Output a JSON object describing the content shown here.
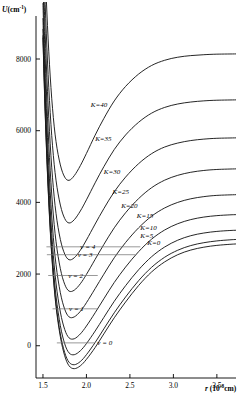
{
  "figure": {
    "y_axis": {
      "label_main": "U",
      "label_units": "(cm",
      "label_exp": "-1",
      "label_close": ")"
    },
    "x_axis": {
      "label_main": "r",
      "label_units": "(10",
      "label_exp": "-8",
      "label_close": "cm)"
    }
  },
  "chart_data": {
    "type": "line",
    "title": "",
    "xlabel": "r (10^-8 cm)",
    "ylabel": "U (cm^-1)",
    "xlim": [
      1.42,
      3.72
    ],
    "ylim": [
      -900,
      9200
    ],
    "xticks": [
      1.5,
      2.0,
      2.5,
      3.0,
      3.5
    ],
    "xticklabels": [
      "1.5",
      "2.0",
      "2.5",
      "3.0",
      "3.5"
    ],
    "yticks": [
      0,
      2000,
      4000,
      6000,
      8000
    ],
    "yticklabels": [
      "0",
      "2000",
      "4000",
      "6000",
      "8000"
    ],
    "grid": false,
    "legend": "inline-annotations",
    "series": [
      {
        "name": "K=0",
        "K": 0,
        "label": "K=0",
        "label_x": 2.7,
        "label_y": 2760,
        "values": [
          [
            1.5,
            8600
          ],
          [
            1.52,
            6900
          ],
          [
            1.545,
            5200
          ],
          [
            1.575,
            3600
          ],
          [
            1.61,
            2200
          ],
          [
            1.65,
            1100
          ],
          [
            1.7,
            250
          ],
          [
            1.75,
            -280
          ],
          [
            1.8,
            -560
          ],
          [
            1.86,
            -640
          ],
          [
            1.93,
            -560
          ],
          [
            2.0,
            -380
          ],
          [
            2.1,
            -50
          ],
          [
            2.2,
            330
          ],
          [
            2.32,
            780
          ],
          [
            2.45,
            1220
          ],
          [
            2.6,
            1680
          ],
          [
            2.75,
            2060
          ],
          [
            2.9,
            2340
          ],
          [
            3.05,
            2540
          ],
          [
            3.2,
            2670
          ],
          [
            3.35,
            2750
          ],
          [
            3.5,
            2800
          ],
          [
            3.65,
            2830
          ],
          [
            3.72,
            2840
          ]
        ]
      },
      {
        "name": "K=5",
        "K": 5,
        "label": "K=5",
        "label_x": 2.62,
        "label_y": 2960,
        "values": [
          [
            1.5,
            8660
          ],
          [
            1.52,
            6960
          ],
          [
            1.545,
            5260
          ],
          [
            1.575,
            3665
          ],
          [
            1.61,
            2270
          ],
          [
            1.65,
            1175
          ],
          [
            1.7,
            330
          ],
          [
            1.75,
            -190
          ],
          [
            1.8,
            -460
          ],
          [
            1.86,
            -530
          ],
          [
            1.93,
            -440
          ],
          [
            2.0,
            -250
          ],
          [
            2.1,
            90
          ],
          [
            2.2,
            470
          ],
          [
            2.32,
            920
          ],
          [
            2.45,
            1360
          ],
          [
            2.6,
            1815
          ],
          [
            2.75,
            2190
          ],
          [
            2.9,
            2470
          ],
          [
            3.05,
            2665
          ],
          [
            3.2,
            2795
          ],
          [
            3.35,
            2875
          ],
          [
            3.5,
            2925
          ],
          [
            3.65,
            2955
          ],
          [
            3.72,
            2965
          ]
        ]
      },
      {
        "name": "K=10",
        "K": 10,
        "label": "K=10",
        "label_x": 2.62,
        "label_y": 3180,
        "values": [
          [
            1.5,
            8840
          ],
          [
            1.52,
            7140
          ],
          [
            1.545,
            5450
          ],
          [
            1.575,
            3860
          ],
          [
            1.61,
            2475
          ],
          [
            1.65,
            1390
          ],
          [
            1.7,
            560
          ],
          [
            1.75,
            55
          ],
          [
            1.8,
            -200
          ],
          [
            1.86,
            -250
          ],
          [
            1.93,
            -140
          ],
          [
            2.0,
            60
          ],
          [
            2.1,
            410
          ],
          [
            2.2,
            790
          ],
          [
            2.32,
            1240
          ],
          [
            2.45,
            1675
          ],
          [
            2.6,
            2120
          ],
          [
            2.75,
            2485
          ],
          [
            2.9,
            2755
          ],
          [
            3.05,
            2945
          ],
          [
            3.2,
            3070
          ],
          [
            3.35,
            3145
          ],
          [
            3.5,
            3190
          ],
          [
            3.65,
            3215
          ],
          [
            3.72,
            3222
          ]
        ]
      },
      {
        "name": "K=15",
        "K": 15,
        "label": "K=15",
        "label_x": 2.58,
        "label_y": 3520,
        "values": [
          [
            1.5,
            9140
          ],
          [
            1.52,
            7445
          ],
          [
            1.545,
            5765
          ],
          [
            1.575,
            4190
          ],
          [
            1.61,
            2820
          ],
          [
            1.65,
            1750
          ],
          [
            1.7,
            940
          ],
          [
            1.75,
            455
          ],
          [
            1.8,
            220
          ],
          [
            1.86,
            195
          ],
          [
            1.93,
            330
          ],
          [
            2.0,
            550
          ],
          [
            2.1,
            920
          ],
          [
            2.2,
            1310
          ],
          [
            2.32,
            1765
          ],
          [
            2.45,
            2195
          ],
          [
            2.6,
            2625
          ],
          [
            2.75,
            2975
          ],
          [
            2.9,
            3230
          ],
          [
            3.05,
            3405
          ],
          [
            3.2,
            3520
          ],
          [
            3.35,
            3590
          ],
          [
            3.5,
            3630
          ],
          [
            3.65,
            3652
          ],
          [
            3.72,
            3658
          ]
        ]
      },
      {
        "name": "K=20",
        "K": 20,
        "label": "K=20",
        "label_x": 2.4,
        "label_y": 3800,
        "values": [
          [
            1.5,
            9560
          ],
          [
            1.52,
            7875
          ],
          [
            1.545,
            6210
          ],
          [
            1.575,
            4655
          ],
          [
            1.61,
            3310
          ],
          [
            1.65,
            2265
          ],
          [
            1.7,
            1480
          ],
          [
            1.75,
            1020
          ],
          [
            1.8,
            805
          ],
          [
            1.86,
            805
          ],
          [
            1.93,
            960
          ],
          [
            2.0,
            1200
          ],
          [
            2.1,
            1595
          ],
          [
            2.2,
            1995
          ],
          [
            2.32,
            2455
          ],
          [
            2.45,
            2880
          ],
          [
            2.6,
            3290
          ],
          [
            2.75,
            3615
          ],
          [
            2.9,
            3845
          ],
          [
            3.05,
            4000
          ],
          [
            3.2,
            4100
          ],
          [
            3.35,
            4160
          ],
          [
            3.5,
            4195
          ],
          [
            3.72,
            4215
          ]
        ]
      },
      {
        "name": "K=25",
        "K": 25,
        "label": "K=25",
        "label_x": 2.3,
        "label_y": 4180,
        "values": [
          [
            1.5,
            10100
          ],
          [
            1.52,
            8430
          ],
          [
            1.545,
            6785
          ],
          [
            1.575,
            5250
          ],
          [
            1.61,
            3930
          ],
          [
            1.65,
            2910
          ],
          [
            1.7,
            2150
          ],
          [
            1.75,
            1715
          ],
          [
            1.8,
            1525
          ],
          [
            1.86,
            1550
          ],
          [
            1.93,
            1730
          ],
          [
            2.0,
            1990
          ],
          [
            2.1,
            2410
          ],
          [
            2.2,
            2825
          ],
          [
            2.32,
            3290
          ],
          [
            2.45,
            3710
          ],
          [
            2.6,
            4105
          ],
          [
            2.75,
            4410
          ],
          [
            2.9,
            4620
          ],
          [
            3.05,
            4755
          ],
          [
            3.2,
            4840
          ],
          [
            3.35,
            4890
          ],
          [
            3.5,
            4918
          ],
          [
            3.72,
            4935
          ]
        ]
      },
      {
        "name": "K=30",
        "K": 30,
        "label": "K=30",
        "label_x": 2.2,
        "label_y": 4760,
        "values": [
          [
            1.5,
            10770
          ],
          [
            1.52,
            9115
          ],
          [
            1.545,
            7490
          ],
          [
            1.575,
            5980
          ],
          [
            1.61,
            4685
          ],
          [
            1.65,
            3695
          ],
          [
            1.7,
            2965
          ],
          [
            1.75,
            2560
          ],
          [
            1.8,
            2400
          ],
          [
            1.86,
            2455
          ],
          [
            1.93,
            2665
          ],
          [
            2.0,
            2950
          ],
          [
            2.1,
            3395
          ],
          [
            2.2,
            3825
          ],
          [
            2.32,
            4295
          ],
          [
            2.45,
            4705
          ],
          [
            2.6,
            5080
          ],
          [
            2.75,
            5360
          ],
          [
            2.9,
            5545
          ],
          [
            3.05,
            5655
          ],
          [
            3.2,
            5725
          ],
          [
            3.35,
            5765
          ],
          [
            3.5,
            5788
          ],
          [
            3.72,
            5800
          ]
        ]
      },
      {
        "name": "K=35",
        "K": 35,
        "label": "K=35",
        "label_x": 2.1,
        "label_y": 5680,
        "values": [
          [
            1.5,
            11570
          ],
          [
            1.52,
            9935
          ],
          [
            1.545,
            8330
          ],
          [
            1.575,
            6845
          ],
          [
            1.61,
            5580
          ],
          [
            1.65,
            4620
          ],
          [
            1.7,
            3925
          ],
          [
            1.75,
            3550
          ],
          [
            1.8,
            3425
          ],
          [
            1.86,
            3515
          ],
          [
            1.93,
            3760
          ],
          [
            2.0,
            4070
          ],
          [
            2.1,
            4545
          ],
          [
            2.2,
            4995
          ],
          [
            2.32,
            5475
          ],
          [
            2.45,
            5880
          ],
          [
            2.6,
            6235
          ],
          [
            2.75,
            6490
          ],
          [
            2.9,
            6650
          ],
          [
            3.05,
            6745
          ],
          [
            3.2,
            6800
          ],
          [
            3.35,
            6832
          ],
          [
            3.5,
            6850
          ],
          [
            3.72,
            6860
          ]
        ]
      },
      {
        "name": "K=40",
        "K": 40,
        "label": "K=40",
        "label_x": 2.05,
        "label_y": 6620,
        "values": [
          [
            1.5,
            12500
          ],
          [
            1.52,
            10890
          ],
          [
            1.545,
            9310
          ],
          [
            1.575,
            7855
          ],
          [
            1.61,
            6625
          ],
          [
            1.65,
            5700
          ],
          [
            1.7,
            5045
          ],
          [
            1.75,
            4705
          ],
          [
            1.8,
            4615
          ],
          [
            1.86,
            4745
          ],
          [
            1.93,
            5025
          ],
          [
            2.0,
            5365
          ],
          [
            2.1,
            5875
          ],
          [
            2.2,
            6340
          ],
          [
            2.32,
            6830
          ],
          [
            2.45,
            7235
          ],
          [
            2.6,
            7580
          ],
          [
            2.75,
            7820
          ],
          [
            2.9,
            7965
          ],
          [
            3.05,
            8050
          ],
          [
            3.2,
            8095
          ],
          [
            3.35,
            8120
          ],
          [
            3.5,
            8135
          ],
          [
            3.72,
            8142
          ]
        ]
      }
    ],
    "vibrational_levels": [
      {
        "label": "v = 0",
        "v": 0,
        "energy": 80,
        "x_start": 1.66,
        "x_end": 2.095,
        "label_x": 2.125,
        "label_y": 80
      },
      {
        "label": "v = 1",
        "v": 1,
        "energy": 1030,
        "x_start": 1.61,
        "x_end": 2.12,
        "label_x": 1.8,
        "label_y": 1030
      },
      {
        "label": "v = 2",
        "v": 2,
        "energy": 1960,
        "x_start": 1.56,
        "x_end": 2.13,
        "label_x": 1.79,
        "label_y": 1960
      },
      {
        "label": "v = 3",
        "v": 3,
        "energy": 2540,
        "x_start": 1.545,
        "x_end": 2.56,
        "label_x": 1.9,
        "label_y": 2540
      },
      {
        "label": "v = 4",
        "v": 4,
        "energy": 2760,
        "x_start": 1.54,
        "x_end": 2.62,
        "label_x": 1.93,
        "label_y": 2760
      }
    ]
  }
}
